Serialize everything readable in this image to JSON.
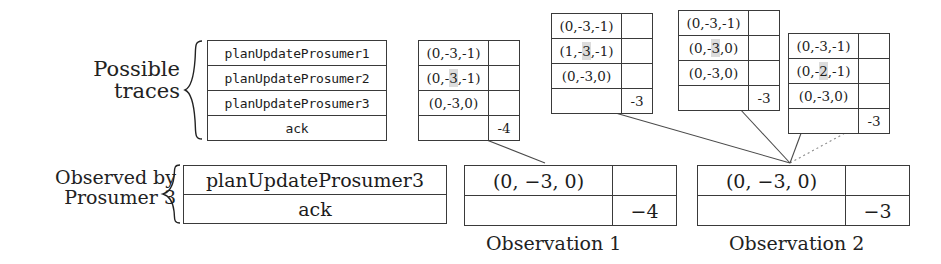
{
  "labels": {
    "possible_traces_line1": "Possible",
    "possible_traces_line2": "traces",
    "observed_by_line1": "Observed by",
    "observed_by_line2": "Prosumer 3",
    "observation1_caption": "Observation 1",
    "observation2_caption": "Observation 2"
  },
  "traces_table": {
    "rows": [
      "planUpdateProsumer1",
      "planUpdateProsumer2",
      "planUpdateProsumer3",
      "ack"
    ]
  },
  "vector_tables": [
    {
      "name": "vector-table-1",
      "rows": [
        {
          "vector_prefix": "(0,-",
          "vector_highlight": "3",
          "vector_suffix": ",-1)",
          "num": ""
        },
        {
          "vector_prefix": "(0,-",
          "vector_highlight": "3",
          "vector_suffix": ",-1)",
          "num": "",
          "shaded": true
        },
        {
          "vector_prefix": "(0,-",
          "vector_highlight": "3",
          "vector_suffix": ",0)",
          "num": ""
        },
        {
          "vector_prefix": "",
          "vector_highlight": "",
          "vector_suffix": "",
          "num": "-4"
        }
      ]
    },
    {
      "name": "vector-table-2",
      "rows": [
        {
          "vector_prefix": "(0,-",
          "vector_highlight": "3",
          "vector_suffix": ",-1)",
          "num": ""
        },
        {
          "vector_prefix": "(1,-",
          "vector_highlight": "3",
          "vector_suffix": ",-1)",
          "num": "",
          "shaded": true
        },
        {
          "vector_prefix": "(0,-",
          "vector_highlight": "3",
          "vector_suffix": ",0)",
          "num": ""
        },
        {
          "vector_prefix": "",
          "vector_highlight": "",
          "vector_suffix": "",
          "num": "-3"
        }
      ]
    },
    {
      "name": "vector-table-3",
      "rows": [
        {
          "vector_prefix": "(0,-",
          "vector_highlight": "3",
          "vector_suffix": ",-1)",
          "num": ""
        },
        {
          "vector_prefix": "(0,-",
          "vector_highlight": "3",
          "vector_suffix": ",0)",
          "num": "",
          "shaded": true
        },
        {
          "vector_prefix": "(0,-",
          "vector_highlight": "3",
          "vector_suffix": ",0)",
          "num": ""
        },
        {
          "vector_prefix": "",
          "vector_highlight": "",
          "vector_suffix": "",
          "num": "-3"
        }
      ]
    },
    {
      "name": "vector-table-4",
      "rows": [
        {
          "vector_prefix": "(0,-",
          "vector_highlight": "3",
          "vector_suffix": ",-1)",
          "num": ""
        },
        {
          "vector_prefix": "(0,-",
          "vector_highlight": "2",
          "vector_suffix": ",-1)",
          "num": "",
          "shaded": true
        },
        {
          "vector_prefix": "(0,-",
          "vector_highlight": "3",
          "vector_suffix": ",0)",
          "num": ""
        },
        {
          "vector_prefix": "",
          "vector_highlight": "",
          "vector_suffix": "",
          "num": "-3"
        }
      ]
    }
  ],
  "observed_table": {
    "rows": [
      "planUpdateProsumer3",
      "ack"
    ]
  },
  "observation1": {
    "row1_vector": "(0, −3, 0)",
    "row1_num": "",
    "row2_vector": "",
    "row2_num": "−4"
  },
  "observation2": {
    "row1_vector": "(0, −3, 0)",
    "row1_num": "",
    "row2_vector": "",
    "row2_num": "−3"
  },
  "colors": {
    "stroke": "#3a3a3a",
    "text": "#1c1c1c",
    "highlight": "#dcdcdc",
    "background": "#ffffff"
  }
}
